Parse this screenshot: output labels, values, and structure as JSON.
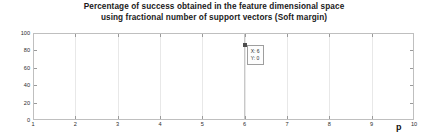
{
  "chart_data": {
    "type": "line",
    "title": "Percentage of success obtained in the feature dimensional space using fractional number of support vectors (Soft margin)",
    "title_lines": [
      "Percentage of success obtained in the feature dimensional space",
      "using fractional number of support vectors (Soft margin)"
    ],
    "xlabel": "p",
    "ylabel": "",
    "xlim": [
      1,
      10
    ],
    "ylim": [
      0,
      100
    ],
    "xticks": [
      1,
      2,
      3,
      4,
      5,
      6,
      7,
      8,
      9,
      10
    ],
    "xtick_labels": [
      "1",
      "2",
      "3",
      "4",
      "5",
      "6",
      "7",
      "8",
      "9",
      "10"
    ],
    "yticks": [
      0,
      20,
      40,
      60,
      80,
      100
    ],
    "ytick_labels": [
      "0",
      "20",
      "40",
      "60",
      "80",
      "100"
    ],
    "grid": true,
    "legend": null,
    "series": [
      {
        "name": "percentage of success",
        "x": [],
        "values": []
      }
    ],
    "annotations": [
      {
        "type": "datatip",
        "x": 6,
        "y": 0,
        "lines": [
          "X: 6",
          "Y: 0"
        ]
      }
    ],
    "colors": {
      "axes_border": "#bfbfbf",
      "grid": "#e8e8e8",
      "text": "#2b2b2b",
      "title": "#1a1a1a",
      "datatip_border": "#9e9e9e",
      "datatip_bg": "#fdfdfd",
      "marker": "#4d4d4d",
      "background": "#ffffff"
    }
  }
}
